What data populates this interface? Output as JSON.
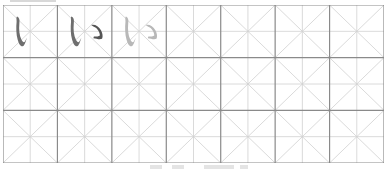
{
  "worksheet": {
    "type": "hiragana-writing-practice",
    "character": "い",
    "columns": 7,
    "rows": 3,
    "colors": {
      "cell_border": "#8a8a8a",
      "guide_line": "#d0d0d0",
      "stroke_dark": "#6e6e6e",
      "stroke_darker": "#555555",
      "stroke_trace": "#b8b8b8"
    },
    "example_cells": [
      {
        "index": 0,
        "label": "stroke 1 of い",
        "strokes": 1,
        "style": "dark"
      },
      {
        "index": 1,
        "label": "full い",
        "strokes": 2,
        "style": "dark"
      },
      {
        "index": 2,
        "label": "trace い",
        "strokes": 2,
        "style": "trace"
      }
    ]
  }
}
